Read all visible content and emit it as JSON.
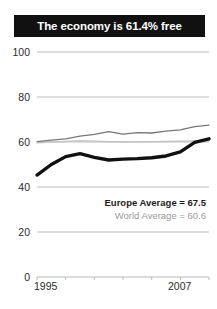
{
  "title": {
    "text": "The economy is 61.4% free"
  },
  "annotations": {
    "europe": "Europe Average = 67.5",
    "world": "World Average = 60.6"
  },
  "colors": {
    "title_background": "#111111",
    "title_text": "#ffffff",
    "country_line": "#111111",
    "europe_line": "#777777",
    "world_line": "#c2c2c2",
    "gridline": "#b5b5b5",
    "axis_text": "#2b2b2b"
  },
  "chart_data": {
    "type": "line",
    "title": "The economy is 61.4% free",
    "xlabel": "",
    "ylabel": "",
    "ylim": [
      0,
      100
    ],
    "yticks": [
      0,
      20,
      40,
      60,
      80,
      100
    ],
    "xlim": [
      1995,
      2007
    ],
    "xticks": [
      1995,
      2007
    ],
    "xtick_labels": [
      "1995",
      "2007"
    ],
    "grid": true,
    "legend": "none",
    "x": [
      1995,
      1996,
      1997,
      1998,
      1999,
      2000,
      2001,
      2002,
      2003,
      2004,
      2005,
      2006,
      2007
    ],
    "series": [
      {
        "name": "Country",
        "style": "thick-black",
        "color": "#111111",
        "values": [
          45.3,
          50.0,
          53.5,
          54.8,
          53.2,
          52.0,
          52.4,
          52.6,
          53.0,
          53.8,
          55.6,
          59.8,
          61.4
        ]
      },
      {
        "name": "Europe Average",
        "style": "thin-dark-gray",
        "color": "#777777",
        "values": [
          60.2,
          60.8,
          61.4,
          62.6,
          63.4,
          64.6,
          63.5,
          64.2,
          64.0,
          64.8,
          65.4,
          66.8,
          67.5
        ]
      },
      {
        "name": "World Average",
        "style": "thin-light-gray",
        "color": "#c2c2c2",
        "values": [
          59.6,
          60.0,
          60.3,
          60.6,
          60.4,
          60.2,
          60.0,
          60.1,
          60.2,
          60.3,
          60.4,
          60.5,
          60.6
        ]
      }
    ],
    "annotations": [
      {
        "text": "Europe Average = 67.5",
        "emphasis": "bold"
      },
      {
        "text": "World Average = 60.6",
        "emphasis": "muted"
      }
    ]
  }
}
